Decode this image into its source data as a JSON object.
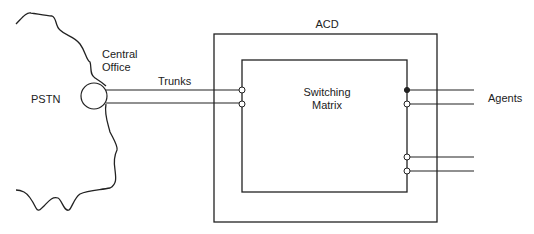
{
  "diagram": {
    "labels": {
      "pstn": "PSTN",
      "central_office_line1": "Central",
      "central_office_line2": "Office",
      "trunks": "Trunks",
      "acd": "ACD",
      "switching_line1": "Switching",
      "switching_line2": "Matrix",
      "agents": "Agents"
    },
    "nodes": [
      {
        "id": "pstn",
        "label": "PSTN",
        "shape": "cloud-edge"
      },
      {
        "id": "central-office",
        "label": "Central Office",
        "shape": "circle"
      },
      {
        "id": "acd",
        "label": "ACD",
        "shape": "rectangle"
      },
      {
        "id": "switching-matrix",
        "label": "Switching Matrix",
        "shape": "rectangle",
        "parent": "acd"
      },
      {
        "id": "agents",
        "label": "Agents",
        "shape": "line-group"
      }
    ],
    "edges": [
      {
        "from": "central-office",
        "to": "switching-matrix",
        "label": "Trunks",
        "count": 2
      },
      {
        "from": "switching-matrix",
        "to": "agents",
        "count": 4
      }
    ],
    "colors": {
      "stroke": "#222222",
      "background": "#ffffff"
    }
  }
}
